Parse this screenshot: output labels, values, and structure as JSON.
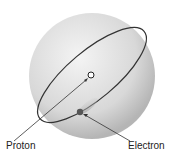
{
  "diagram": {
    "labels": {
      "proton": "Proton",
      "electron": "Electron"
    },
    "colors": {
      "sphere_light": "#f2f2f2",
      "sphere_dark": "#b8b8b8",
      "orbit": "#333333"
    }
  }
}
